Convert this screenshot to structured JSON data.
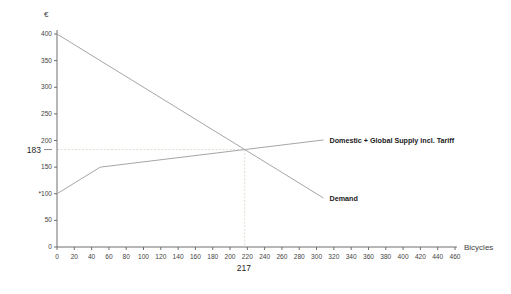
{
  "chart_data": {
    "type": "line",
    "title": "",
    "xlabel": "Bicycles",
    "ylabel": "€",
    "xlim": [
      0,
      460
    ],
    "ylim": [
      0,
      400
    ],
    "grid": false,
    "legend": "inline labels at right end of each line",
    "x_ticks": [
      0,
      20,
      40,
      60,
      80,
      100,
      120,
      140,
      160,
      180,
      200,
      220,
      240,
      260,
      280,
      300,
      320,
      340,
      360,
      380,
      400,
      420,
      440,
      460
    ],
    "y_ticks": [
      0,
      50,
      100,
      150,
      200,
      250,
      300,
      350,
      400
    ],
    "y_tick_labels": [
      "0",
      "50",
      "*100",
      "150",
      "200",
      "250",
      "300",
      "350",
      "400"
    ],
    "series": [
      {
        "name": "Demand",
        "points": [
          [
            0,
            400
          ],
          [
            308,
            92
          ]
        ],
        "color": "#a6a6a6"
      },
      {
        "name": "Domestic + Global Supply incl. Tariff",
        "points": [
          [
            0,
            100
          ],
          [
            50,
            150
          ],
          [
            308,
            201
          ]
        ],
        "color": "#a6a6a6"
      }
    ],
    "equilibrium": {
      "x": 217,
      "y": 183,
      "x_label": "217",
      "y_label": "183",
      "guide_color": "#deded2"
    },
    "axis_color": "#6e6e6e",
    "tick_text_color": "#3f3f3f"
  },
  "labels": {
    "y_axis_title": "€",
    "x_axis_title": "Bicycles",
    "supply_label": "Domestic  + Global Supply incl. Tariff",
    "demand_label": "Demand",
    "equilibrium_price": "183",
    "equilibrium_quantity": "217"
  }
}
